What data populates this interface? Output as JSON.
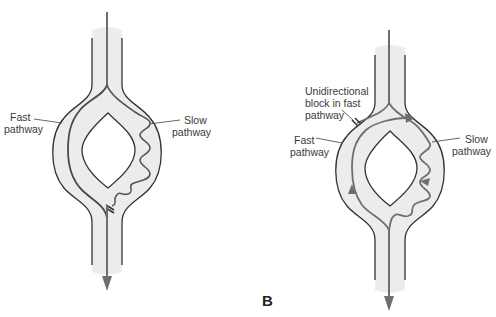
{
  "figure": {
    "panel_a": {
      "labels": {
        "fast_line1": "Fast",
        "fast_line2": "pathway",
        "slow_line1": "Slow",
        "slow_line2": "pathway"
      }
    },
    "panel_b": {
      "letter": "B",
      "labels": {
        "block_line1": "Unidirectional",
        "block_line2": "block in fast",
        "block_line3": "pathway",
        "fast_line1": "Fast",
        "fast_line2": "pathway",
        "slow_line1": "Slow",
        "slow_line2": "pathway"
      }
    },
    "colors": {
      "tissue_fill": "#ececec",
      "wall": "#333333",
      "conduction": "#6e6e6e",
      "background": "#ffffff"
    }
  }
}
